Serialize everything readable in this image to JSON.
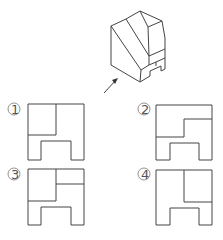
{
  "figure": {
    "arrow_label": ""
  },
  "options": [
    {
      "label": "①",
      "id": "1"
    },
    {
      "label": "②",
      "id": "2"
    },
    {
      "label": "③",
      "id": "3"
    },
    {
      "label": "④",
      "id": "4"
    }
  ]
}
